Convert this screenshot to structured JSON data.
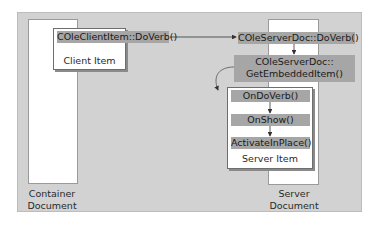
{
  "diagram": {
    "container_document": {
      "label_line1": "Container",
      "label_line2": "Document"
    },
    "server_document": {
      "label_line1": "Server",
      "label_line2": "Document"
    },
    "client_item": {
      "method": "COleClientItem::DoVerb()",
      "label": "Client Item"
    },
    "server_doc_doverb": "COleServerDoc::DoVerb()",
    "server_doc_getembedded": {
      "line1": "COleServerDoc::",
      "line2": "GetEmbeddedItem()"
    },
    "server_item": {
      "methods": [
        "OnDoVerb()",
        "OnShow()",
        "ActivateInPlace()"
      ],
      "label": "Server Item"
    },
    "colors": {
      "panel": "#d2d2d2",
      "method_bar": "#a6a6a6",
      "arrow": "#333333"
    }
  }
}
